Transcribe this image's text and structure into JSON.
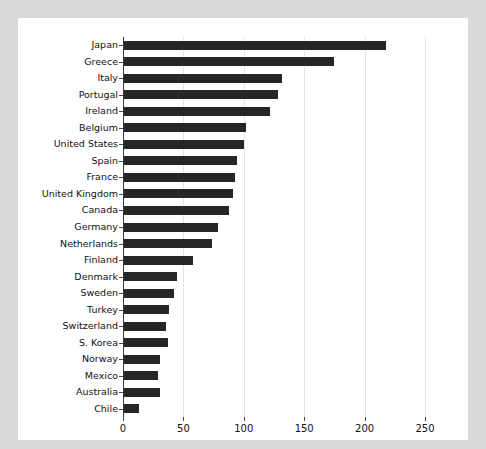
{
  "chart_data": {
    "type": "bar",
    "orientation": "horizontal",
    "title": "",
    "subtitle": "",
    "xlabel": "",
    "ylabel": "",
    "xlim": [
      0,
      250
    ],
    "ylim": null,
    "grid": true,
    "legend": null,
    "xticks": [
      "0",
      "50",
      "100",
      "150",
      "200",
      "250"
    ],
    "xtick_values": [
      0,
      50,
      100,
      150,
      200,
      250
    ],
    "categories": [
      "Japan",
      "Greece",
      "Italy",
      "Portugal",
      "Ireland",
      "Belgium",
      "United States",
      "Spain",
      "France",
      "United Kingdom",
      "Canada",
      "Germany",
      "Netherlands",
      "Finland",
      "Denmark",
      "Sweden",
      "Turkey",
      "Switzerland",
      "S. Korea",
      "Norway",
      "Mexico",
      "Australia",
      "Chile"
    ],
    "values": [
      218,
      175,
      132,
      128,
      122,
      102,
      100,
      94,
      93,
      91,
      88,
      79,
      74,
      58,
      45,
      42,
      38,
      36,
      37,
      31,
      29,
      31,
      13
    ],
    "bar_color": "#262626",
    "grid_color": "#e3e3e3",
    "axis_color": "#3a3a3a",
    "figure_background": "#ffffff",
    "page_background": "#d9d9d9"
  }
}
